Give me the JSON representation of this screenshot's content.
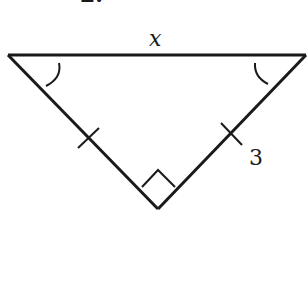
{
  "problem": {
    "number_label": "2."
  },
  "figure": {
    "type": "right isosceles triangle",
    "vertices": {
      "left": [
        8,
        55
      ],
      "right": [
        306,
        55
      ],
      "bottom": [
        158,
        209
      ]
    },
    "hypotenuse_label": "x",
    "leg_label": "3",
    "right_angle_at": "bottom",
    "congruent_legs_marked": true,
    "congruent_base_angles_marked": true,
    "stroke_color": "#1a1a1a",
    "background": "#ffffff"
  }
}
